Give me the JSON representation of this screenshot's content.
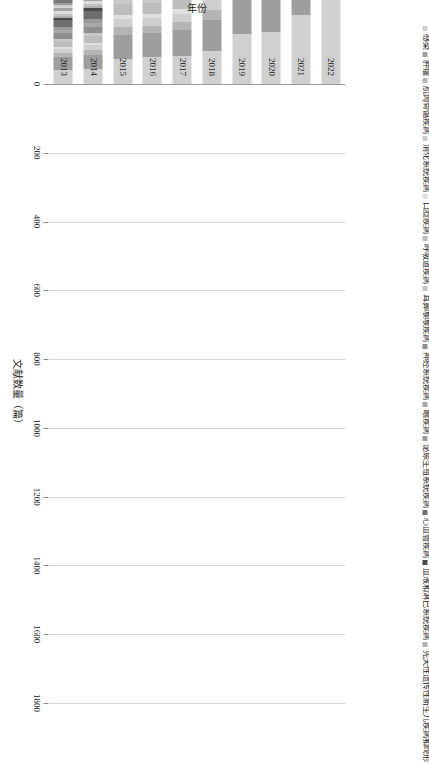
{
  "chart_data": {
    "type": "bar",
    "orientation": "horizontal",
    "stacked": true,
    "title": "",
    "xlabel": "文献数量（篇）",
    "ylabel": "年份",
    "xlim": [
      0,
      1800
    ],
    "xticks": [
      0,
      200,
      400,
      600,
      800,
      1000,
      1200,
      1400,
      1600,
      1800
    ],
    "xticklabels": [
      "0",
      "200",
      "400",
      "600",
      "800",
      "1000",
      "1200",
      "1400",
      "1600",
      "1800"
    ],
    "grid": true,
    "legend_position": "top",
    "categories": [
      "2022",
      "2021",
      "2020",
      "2019",
      "2018",
      "2017",
      "2016",
      "2015",
      "2014",
      "2013"
    ],
    "totals": [
      1663,
      1397,
      1096,
      1070,
      800,
      690,
      648,
      650,
      405,
      350
    ],
    "series": [
      {
        "name": "感染",
        "color": "#d0d0d0",
        "values": [
          268,
          200,
          150,
          145,
          96,
          80,
          78,
          74,
          44,
          42
        ]
      },
      {
        "name": "肿瘤",
        "color": "#9e9e9e",
        "values": [
          175,
          145,
          120,
          118,
          90,
          76,
          70,
          68,
          40,
          36
        ]
      },
      {
        "name": "肌肉骨骼疾病",
        "color": "#b5b5b5",
        "values": [
          60,
          48,
          40,
          38,
          30,
          24,
          22,
          24,
          14,
          12
        ]
      },
      {
        "name": "消化系统疾病",
        "color": "#cfcfcf",
        "values": [
          60,
          46,
          42,
          38,
          28,
          24,
          22,
          22,
          14,
          12
        ]
      },
      {
        "name": "口腍疾病",
        "color": "#e0e0e0",
        "values": [
          34,
          26,
          22,
          20,
          16,
          14,
          13,
          12,
          8,
          7
        ]
      },
      {
        "name": "呼吸道疾病",
        "color": "#bdbdbd",
        "values": [
          86,
          70,
          58,
          54,
          40,
          34,
          32,
          32,
          20,
          17
        ]
      },
      {
        "name": "耳鼻喉喉疾病",
        "color": "#c8c8c8",
        "values": [
          30,
          24,
          20,
          19,
          14,
          12,
          11,
          11,
          7,
          6
        ]
      },
      {
        "name": "神经系统疾病",
        "color": "#8f8f8f",
        "values": [
          84,
          70,
          56,
          54,
          40,
          34,
          32,
          32,
          20,
          17
        ]
      },
      {
        "name": "眼疾病",
        "color": "#a6a6a6",
        "values": [
          36,
          30,
          24,
          23,
          17,
          15,
          14,
          14,
          9,
          7
        ]
      },
      {
        "name": "泌尿生殖系统疾病",
        "color": "#9a9a9a",
        "values": [
          52,
          42,
          34,
          33,
          25,
          21,
          20,
          20,
          12,
          10
        ]
      },
      {
        "name": "心血管疾病",
        "color": "#6e6e6e",
        "values": [
          100,
          84,
          68,
          66,
          49,
          42,
          40,
          40,
          25,
          21
        ]
      },
      {
        "name": "血液和淋巴系统疾病",
        "color": "#4a4a4a",
        "values": [
          30,
          25,
          20,
          20,
          15,
          12,
          12,
          12,
          7,
          6
        ]
      },
      {
        "name": "先天性遗传性新生儿疾病和畸形",
        "color": "#b0b0b0",
        "values": [
          28,
          23,
          19,
          18,
          14,
          11,
          11,
          11,
          7,
          6
        ]
      },
      {
        "name": "皮肤和结缔组织疾病",
        "color": "#c2c2c2",
        "values": [
          24,
          20,
          16,
          16,
          12,
          10,
          9,
          9,
          6,
          5
        ]
      },
      {
        "name": "营养和代谢性疾病",
        "color": "#dcdcdc",
        "values": [
          38,
          31,
          25,
          24,
          18,
          15,
          14,
          14,
          9,
          8
        ]
      },
      {
        "name": "内分泌系统疾病",
        "color": "#a3a3a3",
        "values": [
          46,
          38,
          31,
          30,
          22,
          19,
          18,
          18,
          11,
          9
        ]
      },
      {
        "name": "免疫系统疾病",
        "color": "#d6d6d6",
        "values": [
          26,
          21,
          17,
          17,
          12,
          10,
          10,
          10,
          6,
          5
        ]
      },
      {
        "name": "环境诱发疾病",
        "color": "#c9c9c9",
        "values": [
          22,
          18,
          15,
          14,
          11,
          9,
          8,
          8,
          5,
          4
        ]
      },
      {
        "name": "动物疾病",
        "color": "#9c9c9c",
        "values": [
          34,
          28,
          23,
          22,
          16,
          14,
          13,
          13,
          8,
          7
        ]
      },
      {
        "name": "病理状态、体征和症状",
        "color": "#787878",
        "values": [
          44,
          36,
          29,
          28,
          21,
          18,
          17,
          17,
          11,
          9
        ]
      },
      {
        "name": "职业病",
        "color": "#616161",
        "values": [
          30,
          25,
          20,
          19,
          14,
          12,
          12,
          12,
          7,
          6
        ]
      },
      {
        "name": "化学诱导疾病",
        "color": "#8a8a8a",
        "values": [
          26,
          21,
          17,
          17,
          12,
          11,
          10,
          10,
          6,
          5
        ]
      },
      {
        "name": "创伤和损伤",
        "color": "#555555",
        "values": [
          40,
          33,
          27,
          26,
          19,
          16,
          15,
          15,
          10,
          8
        ]
      },
      {
        "name": "精神障碍",
        "color": "#2e2e2e",
        "values": [
          52,
          43,
          35,
          34,
          25,
          21,
          20,
          20,
          13,
          11
        ]
      },
      {
        "name": "人口特征",
        "color": "#707070",
        "values": [
          38,
          31,
          26,
          25,
          18,
          16,
          15,
          15,
          9,
          8
        ]
      },
      {
        "name": "卫生保健设施、人力和服务",
        "color": "#3a3a3a",
        "values": [
          46,
          38,
          31,
          30,
          22,
          19,
          18,
          18,
          11,
          9
        ]
      },
      {
        "name": "卫生保健经济学和组织",
        "color": "#9b9b9b",
        "values": [
          26,
          21,
          17,
          17,
          12,
          11,
          10,
          10,
          6,
          5
        ]
      },
      {
        "name": "卫生服务管理",
        "color": "#bfbfbf",
        "values": [
          24,
          20,
          16,
          16,
          12,
          10,
          9,
          9,
          6,
          5
        ]
      },
      {
        "name": "卫生保健质量、获取和评价",
        "color": "#8d8d8d",
        "values": [
          40,
          33,
          27,
          26,
          19,
          16,
          15,
          15,
          10,
          8
        ]
      },
      {
        "name": "环境和公共卫生",
        "color": "#d2d2d2",
        "values": [
          64,
          53,
          43,
          41,
          31,
          26,
          25,
          25,
          16,
          13
        ]
      }
    ]
  }
}
